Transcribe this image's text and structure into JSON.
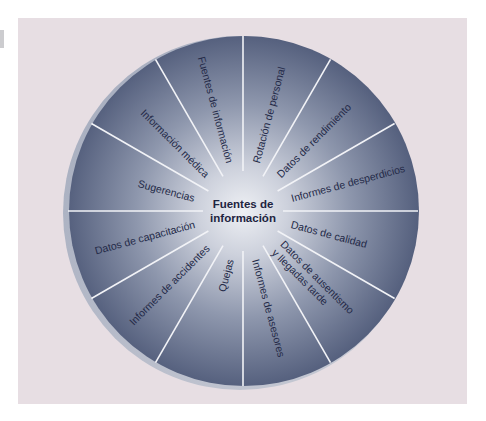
{
  "diagram": {
    "center": {
      "line1": "Fuentes de",
      "line2": "información"
    },
    "segments": [
      {
        "label": "Informes de desperdicios",
        "angle": 15
      },
      {
        "label": "Datos de rendimiento",
        "angle": 45
      },
      {
        "label": "Rotación de personal",
        "angle": 75
      },
      {
        "label": "Fuentes de información",
        "angle": 105
      },
      {
        "label": "Información médica",
        "angle": 135
      },
      {
        "label": "Sugerencias",
        "angle": 165
      },
      {
        "label": "Datos de capacitación",
        "angle": 195
      },
      {
        "label": "Informes de accidentes",
        "angle": 225
      },
      {
        "label": "Quejas",
        "angle": 255
      },
      {
        "label": "Informes de asesores",
        "angle": 285
      },
      {
        "label": "Datos de ausentismo",
        "label2": "y llegadas tarde",
        "angle": 315
      },
      {
        "label": "Datos de calidad",
        "angle": 345
      }
    ],
    "colors": {
      "panel": "#e7dee3",
      "disc_center": "#eceef3",
      "disc_edge": "#56617f",
      "divider": "#f4f4f8",
      "text": "#242a48"
    }
  }
}
